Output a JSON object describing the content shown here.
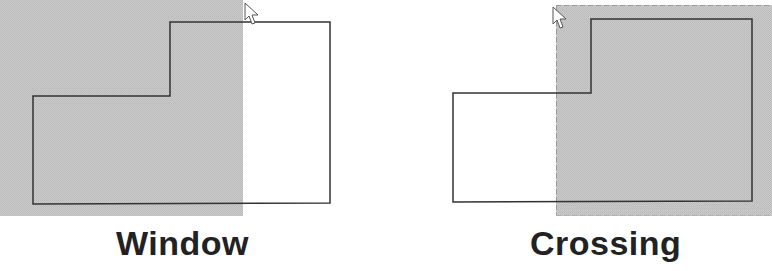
{
  "colors": {
    "selection_fill": "#c4c4c4",
    "outline": "#333333",
    "dash": "#9a9a9a",
    "label": "#222222",
    "background": "#ffffff"
  },
  "panels": [
    {
      "id": "window",
      "label": "Window",
      "selection": {
        "type": "window",
        "border": "solid-none",
        "x": 0,
        "y": 0,
        "w": 243,
        "h": 216
      },
      "shape_points": "33,96 170,96 170,22 330,22 330,203 33,204",
      "cursor": {
        "x": 245,
        "y": 3
      }
    },
    {
      "id": "crossing",
      "label": "Crossing",
      "selection": {
        "type": "crossing",
        "border": "dashed",
        "x": 556,
        "y": 5,
        "w": 216,
        "h": 211
      },
      "shape_points": "453,93 591,93 591,19 752,19 752,201 453,202",
      "cursor": {
        "x": 553,
        "y": 7
      }
    }
  ]
}
